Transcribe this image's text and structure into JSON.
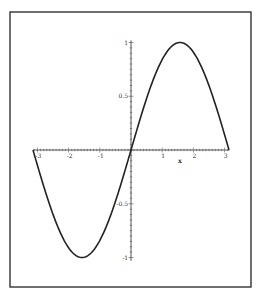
{
  "chart_data": {
    "type": "line",
    "title": "",
    "xlabel": "x",
    "ylabel": "",
    "function": "sin(x)",
    "xlim": [
      -3.14159,
      3.14159
    ],
    "ylim": [
      -1,
      1
    ],
    "grid": false,
    "legend": null,
    "x_ticks": [
      -3,
      -2,
      -1,
      1,
      2,
      3
    ],
    "x_tick_labels": [
      "-3",
      "-2",
      "-1",
      "1",
      "2",
      "3"
    ],
    "y_ticks": [
      1,
      0.5,
      -0.5,
      -1
    ],
    "y_tick_labels": [
      "1",
      "0.5",
      "-0.5",
      "-1"
    ],
    "series": [
      {
        "name": "sin(x)",
        "x": [
          -3.1416,
          -2.5,
          -2.0,
          -1.5708,
          -1.0,
          -0.5,
          0,
          0.5,
          1.0,
          1.5708,
          2.0,
          2.5,
          3.1416
        ],
        "values": [
          0,
          -0.598,
          -0.909,
          -1,
          -0.841,
          -0.479,
          0,
          0.479,
          0.841,
          1,
          0.909,
          0.598,
          0
        ]
      }
    ],
    "colors": {
      "curve": "#222222",
      "axes": "#555555",
      "frame": "#333333"
    }
  }
}
